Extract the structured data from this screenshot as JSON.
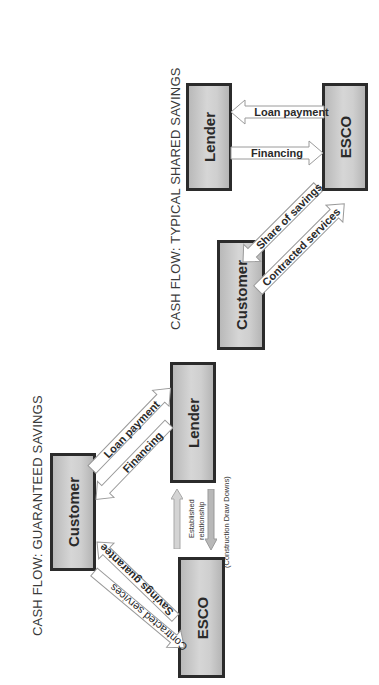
{
  "page": {
    "orientation": "rotated 90 degrees counter-clockwise",
    "colors": {
      "box_fill": "#c8c8c8",
      "box_border": "#2b2b2b",
      "arrow_fill": "#ffffff",
      "arrow_border": "#9a9a9a",
      "relationship_arrow_fill": "#bdbdbd"
    }
  },
  "diagrams": [
    {
      "id": "shared-savings",
      "title": "CASH FLOW:  TYPICAL SHARED SAVINGS",
      "nodes": {
        "lender": "Lender",
        "esco": "ESCO",
        "customer": "Customer"
      },
      "flows": [
        {
          "label": "Loan payment",
          "from": "ESCO",
          "to": "Lender"
        },
        {
          "label": "Financing",
          "from": "Lender",
          "to": "ESCO"
        },
        {
          "label": "Share of savings",
          "from": "ESCO",
          "to": "Customer"
        },
        {
          "label": "Contracted services",
          "from": "Customer",
          "to": "ESCO"
        }
      ]
    },
    {
      "id": "guaranteed-savings",
      "title": "CASH FLOW:  GUARANTEED SAVINGS",
      "nodes": {
        "customer": "Customer",
        "lender": "Lender",
        "esco": "ESCO"
      },
      "flows": [
        {
          "label": "Loan payment",
          "from": "Customer",
          "to": "Lender"
        },
        {
          "label": "Financing",
          "from": "Lender",
          "to": "Customer"
        },
        {
          "label": "Savings guarantee",
          "from": "ESCO",
          "to": "Customer"
        },
        {
          "label": "Contracted services",
          "from": "ESCO",
          "to": "Customer"
        }
      ],
      "relationship": {
        "label_line1": "Established",
        "label_line2": "relationship",
        "note": "(Construction Draw Downs)"
      }
    }
  ]
}
